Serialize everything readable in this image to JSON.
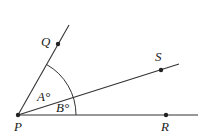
{
  "diagram": {
    "type": "geometry-angles",
    "points": [
      {
        "id": "P",
        "label": "P",
        "x": 18,
        "y": 115,
        "label_x": 14,
        "label_y": 131
      },
      {
        "id": "Q",
        "label": "Q",
        "x": 58,
        "y": 44,
        "label_x": 41,
        "label_y": 46
      },
      {
        "id": "S",
        "label": "S",
        "x": 161,
        "y": 70,
        "label_x": 155,
        "label_y": 61
      },
      {
        "id": "R",
        "label": "R",
        "x": 166,
        "y": 115,
        "label_x": 161,
        "label_y": 131
      }
    ],
    "rays": [
      {
        "from": "P",
        "through": "Q",
        "end_x": 69,
        "end_y": 25
      },
      {
        "from": "P",
        "through": "S",
        "end_x": 179,
        "end_y": 64
      },
      {
        "from": "P",
        "through": "R",
        "end_x": 198,
        "end_y": 115
      }
    ],
    "angles": [
      {
        "label": "A°",
        "between": [
          "Q",
          "S"
        ],
        "label_x": 37,
        "label_y": 101
      },
      {
        "label": "B°",
        "between": [
          "S",
          "R"
        ],
        "label_x": 56,
        "label_y": 112
      }
    ],
    "arc_radius": 58
  }
}
